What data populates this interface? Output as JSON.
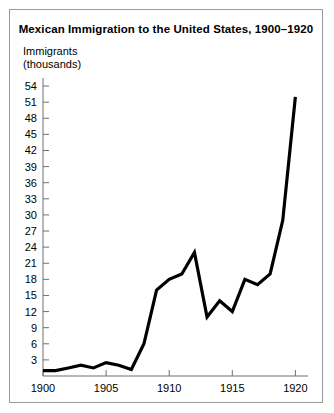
{
  "figure": {
    "title": "Mexican Immigration to the United States, 1900–1920",
    "axis_caption": "Immigrants\n(thousands)",
    "background_color": "#ffffff",
    "border_color": "#9a9a9a",
    "line_color": "#000000"
  },
  "chart_data": {
    "type": "line",
    "title": "Mexican Immigration to the United States, 1900–1920",
    "subtitle": "",
    "xlabel": "",
    "ylabel": "Immigrants (thousands)",
    "x": [
      1900,
      1901,
      1902,
      1903,
      1904,
      1905,
      1906,
      1907,
      1908,
      1909,
      1910,
      1911,
      1912,
      1913,
      1914,
      1915,
      1916,
      1917,
      1918,
      1919,
      1920
    ],
    "values": [
      1,
      1,
      1.5,
      2,
      1.5,
      2.5,
      2,
      1.2,
      6,
      16,
      18,
      19,
      23,
      11,
      14,
      12,
      18,
      17,
      19,
      29,
      52
    ],
    "series": [
      {
        "name": "Immigrants (thousands)",
        "values": [
          1,
          1,
          1.5,
          2,
          1.5,
          2.5,
          2,
          1.2,
          6,
          16,
          18,
          19,
          23,
          11,
          14,
          12,
          18,
          17,
          19,
          29,
          52
        ]
      }
    ],
    "xlim": [
      1900,
      1921
    ],
    "ylim": [
      0,
      55.5
    ],
    "xticks": [
      1900,
      1905,
      1910,
      1915,
      1920
    ],
    "xtick_labels": [
      "1900",
      "1905",
      "1910",
      "1915",
      "1920"
    ],
    "yticks": [
      3,
      6,
      9,
      12,
      15,
      18,
      21,
      24,
      27,
      30,
      33,
      36,
      39,
      42,
      45,
      48,
      51,
      54
    ],
    "ytick_labels": [
      "3",
      "6",
      "9",
      "12",
      "15",
      "18",
      "21",
      "24",
      "27",
      "30",
      "33",
      "36",
      "39",
      "42",
      "45",
      "48",
      "51",
      "54"
    ],
    "grid": false,
    "legend": "none"
  }
}
